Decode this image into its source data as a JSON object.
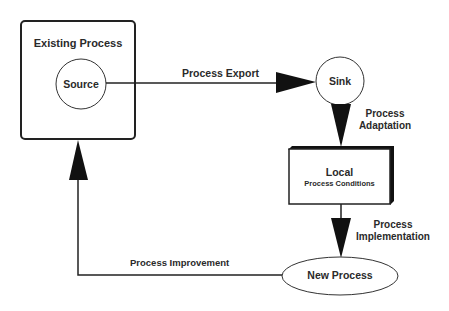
{
  "diagram": {
    "nodes": {
      "existing_process": {
        "label": "Existing Process"
      },
      "source": {
        "label": "Source"
      },
      "sink": {
        "label": "Sink"
      },
      "local": {
        "label": "Local",
        "sublabel": "Process Conditions"
      },
      "new_process": {
        "label": "New Process"
      }
    },
    "edges": {
      "export": {
        "label": "Process Export",
        "from": "Source",
        "to": "Sink"
      },
      "adaptation": {
        "label_line1": "Process",
        "label_line2": "Adaptation",
        "from": "Sink",
        "to": "Local Process Conditions"
      },
      "implementation": {
        "label_line1": "Process",
        "label_line2": "Implementation",
        "from": "Local Process Conditions",
        "to": "New Process"
      },
      "improvement": {
        "label": "Process Improvement",
        "from": "New Process",
        "to": "Existing Process"
      }
    },
    "colors": {
      "stroke": "#222222",
      "fill": "#ffffff",
      "text": "#2a2a2a"
    }
  }
}
